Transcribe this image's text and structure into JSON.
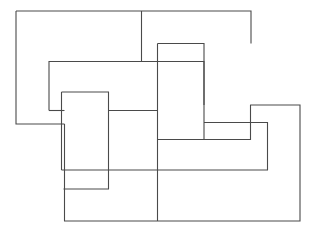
{
  "figure": {
    "canvas": {
      "width": 315,
      "height": 231,
      "background": "#ffffff"
    },
    "stroke": {
      "color": "#4a4a4a",
      "width": 1.1,
      "fill": "none"
    },
    "shapes": [
      {
        "name": "rectangle-top-left",
        "label": "Top left rectangle",
        "bounds": {
          "x": 16,
          "y": 11,
          "width": 235,
          "height": 113
        },
        "path": "M 16 11 L 251 11 L 251 43.5 L 157.5 43.5 L 157.5 61.5 L 141.5 61.5 L 141.5 61.5 L 49 61.5 L 49 110.5 L 64.5 110.5 L 64.5 124 L 16 124 Z"
      },
      {
        "name": "rectangle-upper-band",
        "label": "Upper middle band",
        "bounds": {
          "x": 49,
          "y": 61,
          "width": 155,
          "height": 128
        },
        "path": "M 49 61.5 L 204 61.5 L 204 139.5 L 157.5 139.5 L 157.5 189 L 110.5 189 L 110.5 92 L 61.5 92 L 61.5 110.5 L 49 110.5 Z"
      },
      {
        "name": "rectangle-inner-vertical",
        "label": "Inner vertical rectangle",
        "bounds": {
          "x": 61.5,
          "y": 92,
          "width": 47,
          "height": 97
        },
        "path": "M 61.5 92 L 108.5 92 L 108.5 189 L 61.5 189 Z"
      },
      {
        "name": "rectangle-right-tall",
        "label": "Right tall rectangle",
        "bounds": {
          "x": 157.5,
          "y": 43.5,
          "width": 95,
          "height": 96
        },
        "path": "M 157.5 43.5 L 204 43.5 L 204 105 L 250.5 105 L 250.5 139.5 L 157.5 139.5 Z"
      },
      {
        "name": "rectangle-bottom-right",
        "label": "Bottom right rectangle",
        "bounds": {
          "x": 63.5,
          "y": 105,
          "width": 236.5,
          "height": 116
        },
        "path": "M 63.5 124 L 64.5 124 L 64.5 221 L 300 221 L 300 105 L 250.5 105 L 250.5 122.5 L 267.5 122.5 L 267.5 170 L 63.5 170 Z"
      }
    ],
    "segments": [
      {
        "name": "outer-top-edge",
        "from": [
          16,
          11
        ],
        "to": [
          251,
          11
        ]
      },
      {
        "name": "outer-left-edge",
        "from": [
          16,
          11
        ],
        "to": [
          16,
          124
        ]
      },
      {
        "name": "outer-bottom-left-edge",
        "from": [
          16,
          124
        ],
        "to": [
          64.5,
          124
        ]
      },
      {
        "name": "vertical-divider-top",
        "from": [
          141.5,
          11
        ],
        "to": [
          141.5,
          61.5
        ]
      },
      {
        "name": "right-tall-left-edge",
        "from": [
          251,
          11
        ],
        "to": [
          251,
          43.5
        ]
      },
      {
        "name": "bottom-right-edge",
        "from": [
          300,
          105
        ],
        "to": [
          300,
          221
        ]
      },
      {
        "name": "bottom-edge",
        "from": [
          64.5,
          221
        ],
        "to": [
          300,
          221
        ]
      },
      {
        "name": "bottom-divider",
        "from": [
          157.5,
          170
        ],
        "to": [
          157.5,
          221
        ]
      }
    ]
  }
}
